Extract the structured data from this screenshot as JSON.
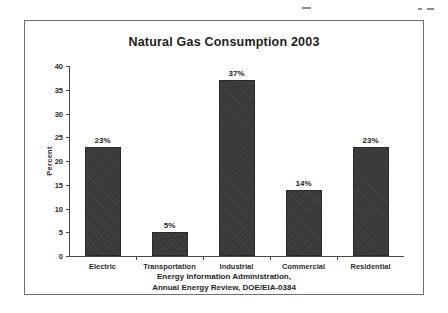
{
  "figure": {
    "title": "Natural Gas Consumption 2003",
    "source_line_1": "Energy Information Administration,",
    "source_line_2": "Annual Energy Review, DOE/EIA-0384"
  },
  "chart_data": {
    "type": "bar",
    "title": "Natural Gas Consumption 2003",
    "xlabel": "",
    "ylabel": "Percent",
    "categories": [
      "Electric",
      "Transportation",
      "Industrial",
      "Commercial",
      "Residential"
    ],
    "values": [
      23,
      5,
      37,
      14,
      23
    ],
    "value_labels": [
      "23%",
      "5%",
      "37%",
      "14%",
      "23%"
    ],
    "ylim": [
      0,
      40
    ],
    "yticks": [
      0,
      5,
      10,
      15,
      20,
      25,
      30,
      35,
      40
    ],
    "ytick_labels": [
      "0",
      "5",
      "10",
      "15",
      "20",
      "25",
      "30",
      "35",
      "40"
    ],
    "grid": false,
    "legend": false,
    "bar_color": "#3a3a3a",
    "axis_color": "#4a4a4a",
    "background": "#ffffff"
  }
}
